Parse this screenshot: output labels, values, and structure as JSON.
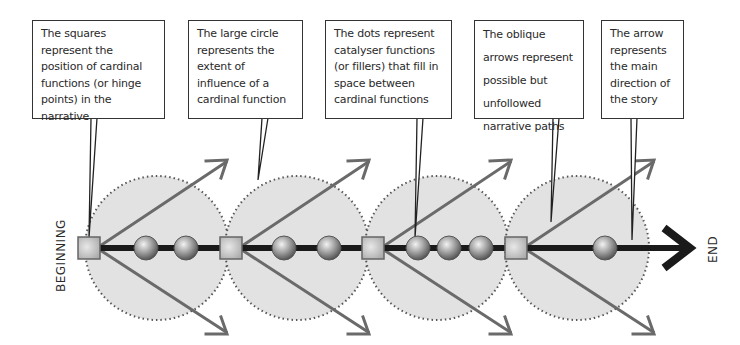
{
  "diagram": {
    "labels": {
      "start": "BEGINNING",
      "end": "END"
    },
    "callouts": [
      {
        "id": "squares",
        "text": "The squares represent the position of cardinal functions (or hinge points) in the narrative"
      },
      {
        "id": "circle",
        "text": "The large circle represents the extent of influence of a cardinal function"
      },
      {
        "id": "dots",
        "text": "The dots represent catalyser functions (or fillers) that fill in space between cardinal functions"
      },
      {
        "id": "oblique",
        "text": "The oblique arrows represent possible but unfollowed narrative paths"
      },
      {
        "id": "arrow",
        "text": "The arrow represents the main direction of the story"
      }
    ],
    "nodes": {
      "cardinal_functions": 4,
      "catalyser_functions_per_segment": [
        2,
        2,
        3,
        1
      ]
    },
    "colors": {
      "circle_fill": "#e2e2e2",
      "circle_border": "#555555",
      "square_fill": "#c8c8c8",
      "square_border": "#666666",
      "main_line": "#1a1a1a",
      "oblique_arrow": "#6a6a6a",
      "callout_border": "#333333",
      "text": "#2a2a2a"
    }
  }
}
